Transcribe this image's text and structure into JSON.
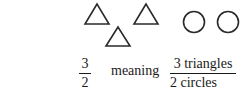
{
  "figure": {
    "shapes": {
      "triangles": [
        {
          "x": 85,
          "y": 3,
          "w": 24,
          "h": 21
        },
        {
          "x": 134,
          "y": 3,
          "w": 24,
          "h": 21
        },
        {
          "x": 106,
          "y": 26,
          "w": 24,
          "h": 21
        }
      ],
      "circles": [
        {
          "cx": 194,
          "cy": 22,
          "r": 11
        },
        {
          "cx": 228,
          "cy": 22,
          "r": 11
        }
      ],
      "stroke_color": "#2a2a2a"
    },
    "left_fraction": {
      "numerator": "3",
      "denominator": "2"
    },
    "connector_word": "meaning",
    "right_fraction": {
      "numerator": "3 triangles",
      "denominator": "2 circles"
    }
  }
}
